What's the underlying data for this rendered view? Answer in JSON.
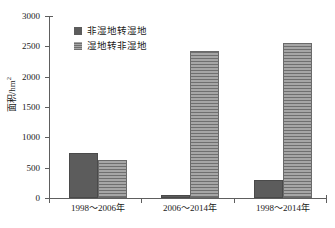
{
  "chart_data": {
    "type": "bar",
    "title": "",
    "xlabel": "",
    "ylabel": "面积/hm²",
    "ylabel_text": "面积/hm",
    "ylabel_sup": "2",
    "categories": [
      "1998～2006年",
      "2006～2014年",
      "1998～2014年"
    ],
    "series": [
      {
        "name": "非湿地转湿地",
        "values": [
          740,
          45,
          295
        ],
        "color": "#5c5c5c",
        "fill": "solid"
      },
      {
        "name": "湿地转非湿地",
        "values": [
          620,
          2420,
          2555
        ],
        "color": "#8f8f8f",
        "fill": "horizontal-hatch"
      }
    ],
    "ylim": [
      0,
      3000
    ],
    "yticks": [
      0,
      500,
      1000,
      1500,
      2000,
      2500,
      3000
    ],
    "ytick_labels": [
      "0",
      "500",
      "1000",
      "1500",
      "2000",
      "2500",
      "3000"
    ],
    "grid": false,
    "legend_position": "top-left"
  },
  "legend": {
    "items": [
      {
        "label": "非湿地转湿地"
      },
      {
        "label": "湿地转非湿地"
      }
    ]
  },
  "axis": {
    "y_labels": [
      "3000",
      "2500",
      "2000",
      "1500",
      "1000",
      "500",
      "0"
    ],
    "x_labels": [
      "1998～2006年",
      "2006～2014年",
      "1998～2014年"
    ]
  }
}
